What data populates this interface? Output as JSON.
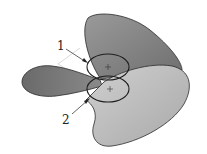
{
  "diagram": {
    "type": "propeller-illustration",
    "labels": [
      {
        "id": "1",
        "text": "1"
      },
      {
        "id": "2",
        "text": "2"
      }
    ],
    "colors": {
      "blade_upper": "#8a8a8a",
      "blade_left": "#6e6e6e",
      "blade_right": "#b8b8b8",
      "outline": "#2a2a2a",
      "circle": "#1e1e1e"
    }
  }
}
